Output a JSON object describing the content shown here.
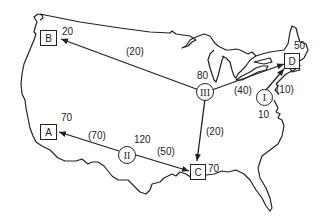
{
  "sources": [
    {
      "id": "I",
      "supply": "10"
    },
    {
      "id": "II",
      "supply": "120"
    },
    {
      "id": "III",
      "supply": "80"
    }
  ],
  "destinations": [
    {
      "id": "A",
      "demand": "70"
    },
    {
      "id": "B",
      "demand": "20"
    },
    {
      "id": "C",
      "demand": "70"
    },
    {
      "id": "D",
      "demand": "50"
    }
  ],
  "flows": [
    {
      "from": "III",
      "to": "B",
      "label": "(20)"
    },
    {
      "from": "III",
      "to": "D",
      "label": "(40)"
    },
    {
      "from": "III",
      "to": "C",
      "label": "(20)"
    },
    {
      "from": "I",
      "to": "D",
      "label": "(10)"
    },
    {
      "from": "II",
      "to": "A",
      "label": "(70)"
    },
    {
      "from": "II",
      "to": "C",
      "label": "(50)"
    }
  ],
  "colors": {
    "ink": "#222222",
    "background": "#ffffff"
  }
}
